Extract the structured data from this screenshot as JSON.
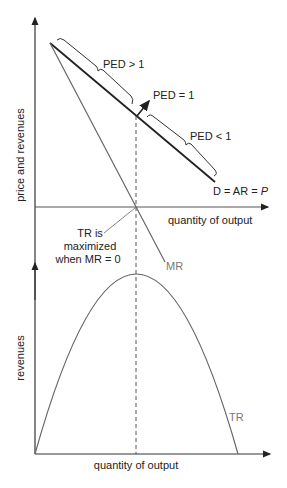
{
  "top_graph": {
    "y_axis_label": "price and revenues",
    "x_axis_label": "quantity of output",
    "demand_label": "D = AR = ",
    "demand_label_italic": "P",
    "mr_label": "MR",
    "ped_elastic": "PED > 1",
    "ped_unit": "PED = 1",
    "ped_inelastic": "PED < 1",
    "annotation_line1": "TR is",
    "annotation_line2": "maximized",
    "annotation_line3": "when MR = 0"
  },
  "bottom_graph": {
    "y_axis_label": "revenues",
    "x_axis_label": "quantity of output",
    "tr_label": "TR"
  },
  "colors": {
    "axis": "#333333",
    "demand": "#222222",
    "mr": "#666666",
    "tr": "#666666",
    "dashed": "#555555"
  }
}
